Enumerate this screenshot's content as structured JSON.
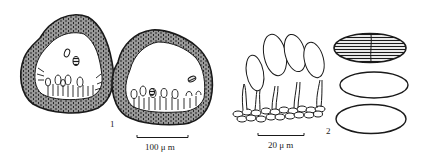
{
  "figure": {
    "panels": [
      {
        "id": "1",
        "label": "1",
        "description": "Two sectioned fruiting bodies with cellular wall and conidiophores lining the base",
        "scale_bar": {
          "label": "100 μ m"
        }
      },
      {
        "id": "2",
        "label": "2",
        "description": "Conidiophores bearing ellipsoid conidia on a basal cell layer, with three detached conidia",
        "scale_bar": {
          "label": "20 μ m"
        }
      }
    ],
    "colors": {
      "ink": "#1a1a1a",
      "background": "#ffffff"
    }
  }
}
